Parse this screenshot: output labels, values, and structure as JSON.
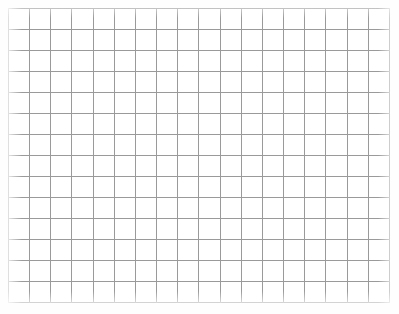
{
  "page": {
    "background_color": "#ffffff",
    "width_px": 399,
    "height_px": 314
  },
  "grid": {
    "name": "blank-graph-paper-grid",
    "columns": 18,
    "rows": 14,
    "total_cells": 252,
    "cell_width_px": 21.2,
    "cell_height_px": 21.1,
    "origin_x_px": 8,
    "origin_y_px": 8,
    "grid_width_px": 382,
    "grid_height_px": 295,
    "line_color": "#9a9a9a",
    "border_color": "#8a8a8a",
    "cell_fill_color": "#ffffff",
    "line_width_px": 1,
    "content": "",
    "labels": [],
    "annotations": []
  }
}
